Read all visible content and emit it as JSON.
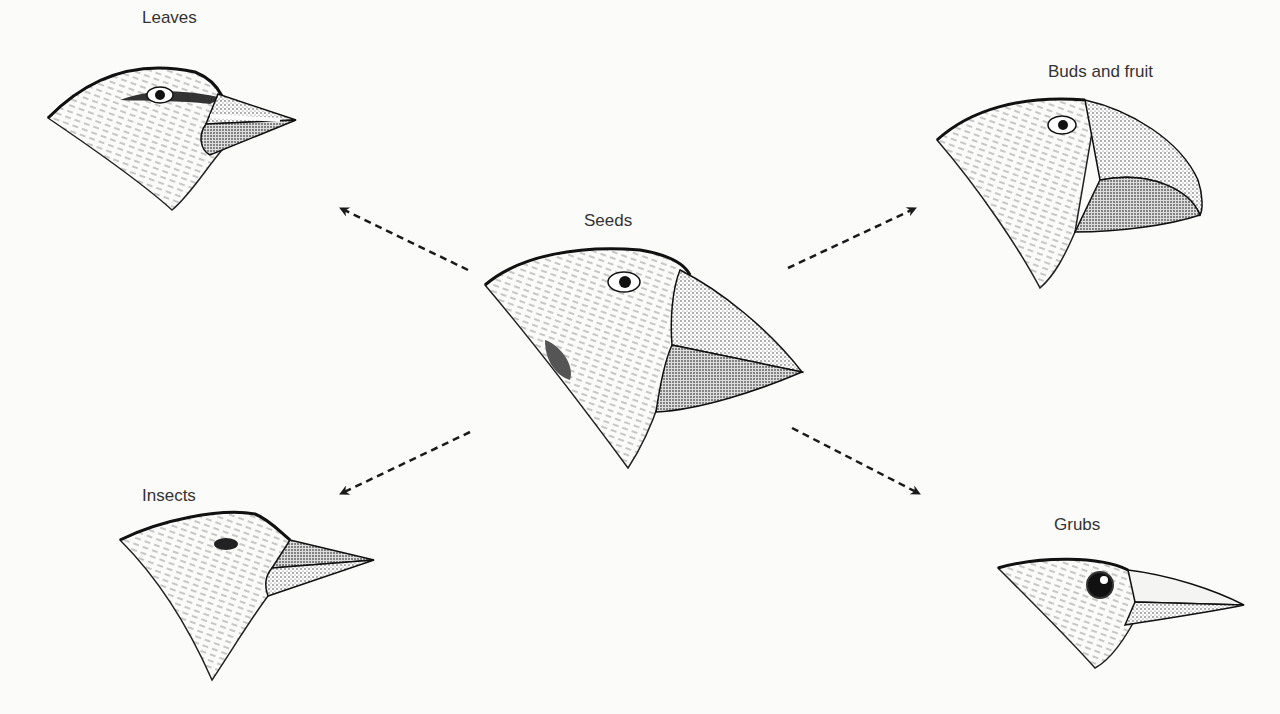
{
  "diagram": {
    "center": {
      "label": "Seeds"
    },
    "branches": [
      {
        "id": "leaves",
        "label": "Leaves"
      },
      {
        "id": "buds-fruit",
        "label": "Buds and fruit"
      },
      {
        "id": "insects",
        "label": "Insects"
      },
      {
        "id": "grubs",
        "label": "Grubs"
      }
    ],
    "arrow_style": "dashed",
    "colors": {
      "ink": "#1a1a1a",
      "background": "#fbfbfa"
    }
  }
}
